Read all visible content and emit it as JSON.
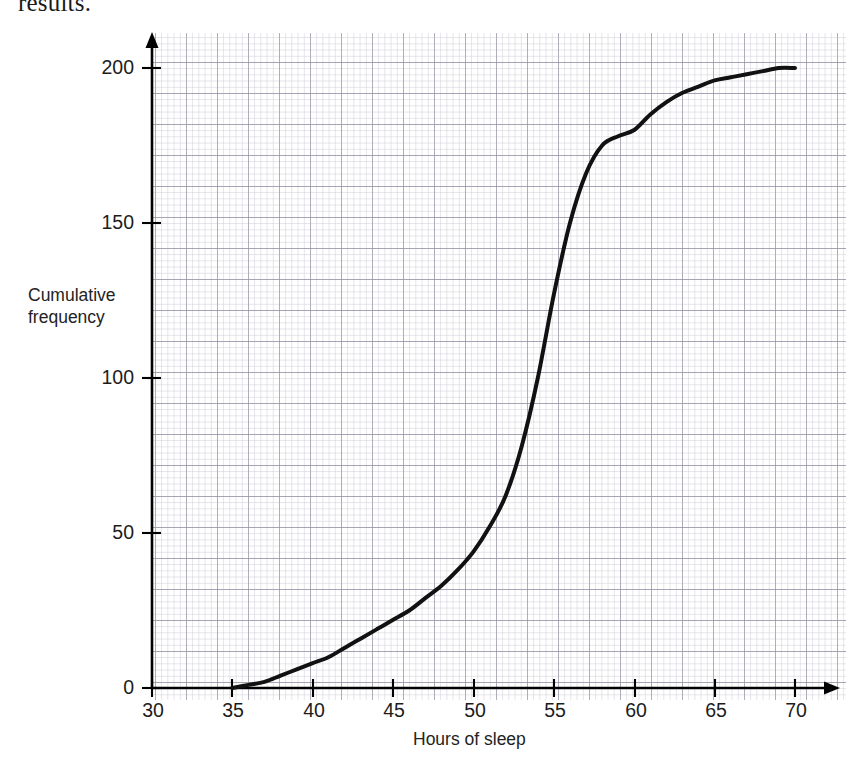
{
  "page": {
    "cutoff_heading": "results."
  },
  "chart_data": {
    "type": "line",
    "title": "",
    "subtitle": "",
    "xlabel": "Hours of sleep",
    "ylabel": "Cumulative frequency",
    "ylabel_lines": [
      "Cumulative",
      "frequency"
    ],
    "xlim": [
      30,
      70
    ],
    "ylim": [
      0,
      200
    ],
    "xticks": [
      30,
      35,
      40,
      45,
      50,
      55,
      60,
      65,
      70
    ],
    "yticks": [
      0,
      50,
      100,
      150,
      200
    ],
    "xtick_labels": [
      "30",
      "35",
      "40",
      "45",
      "50",
      "55",
      "60",
      "65",
      "70"
    ],
    "ytick_labels": [
      "0",
      "50",
      "100",
      "150",
      "200"
    ],
    "grid": true,
    "grid_minor_step_x": 1,
    "grid_minor_step_y": 5,
    "grid_major_step_x": 5,
    "grid_major_step_y": 25,
    "legend": "none",
    "series": [
      {
        "name": "Cumulative frequency",
        "color": "#111111",
        "line_width": 4,
        "x": [
          35,
          36,
          37,
          38,
          39,
          40,
          41,
          42,
          43,
          44,
          45,
          46,
          47,
          48,
          49,
          50,
          51,
          52,
          53,
          54,
          55,
          56,
          57,
          58,
          59,
          60,
          61,
          62,
          63,
          64,
          65,
          66,
          67,
          68,
          69,
          70
        ],
        "values": [
          0,
          1,
          2,
          4,
          6,
          8,
          10,
          13,
          16,
          19,
          22,
          25,
          29,
          33,
          38,
          44,
          52,
          62,
          78,
          100,
          127,
          150,
          166,
          175,
          178,
          180,
          185,
          189,
          192,
          194,
          196,
          197,
          198,
          199,
          200,
          200
        ]
      }
    ],
    "annotations": [],
    "axis_arrows": {
      "x_axis": "right-arrow",
      "y_axis": "up-arrow"
    },
    "grid_color": "#9a9aa8",
    "grid_minor_color": "#c3c3cf",
    "axis_color": "#000000"
  },
  "geometry": {
    "x_origin_px": 152,
    "y_origin_px": 688,
    "px_per_x_unit": 16.08,
    "px_per_y_unit": 3.1,
    "grid_left_px": 152,
    "grid_right_px": 846,
    "grid_top_px": 33,
    "grid_bottom_px": 700
  }
}
